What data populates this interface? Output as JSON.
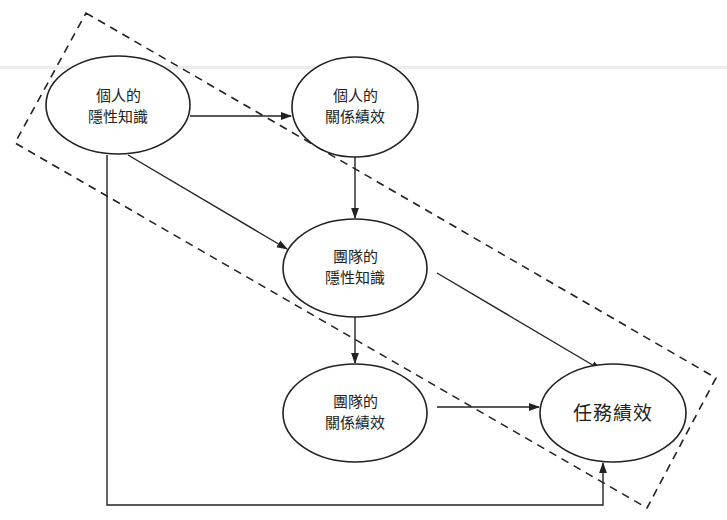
{
  "diagram": {
    "style": {
      "stroke": "#222222",
      "background": "#ffffff"
    },
    "group_boundary": {
      "label": "",
      "style": "dashed",
      "corners": [
        [
          86,
          13
        ],
        [
          716,
          378
        ],
        [
          647,
          508
        ],
        [
          15,
          143
        ]
      ]
    },
    "nodes": [
      {
        "id": "individual-tacit-knowledge",
        "line1": "個人的",
        "line2": "隱性知識",
        "cx": 118,
        "cy": 105,
        "rx": 72,
        "ry": 49
      },
      {
        "id": "individual-relational-performance",
        "line1": "個人的",
        "line2": "關係績效",
        "cx": 355,
        "cy": 107,
        "rx": 63,
        "ry": 50
      },
      {
        "id": "team-tacit-knowledge",
        "line1": "團隊的",
        "line2": "隱性知識",
        "cx": 355,
        "cy": 268,
        "rx": 72,
        "ry": 49
      },
      {
        "id": "team-relational-performance",
        "line1": "團隊的",
        "line2": "關係績效",
        "cx": 355,
        "cy": 413,
        "rx": 72,
        "ry": 49
      },
      {
        "id": "task-performance",
        "line1": "任務績效",
        "line2": "",
        "cx": 613,
        "cy": 413,
        "rx": 73,
        "ry": 49
      }
    ],
    "edges": [
      {
        "from": "個人的隱性知識",
        "to": "個人的關係績效"
      },
      {
        "from": "個人的隱性知識",
        "to": "團隊的隱性知識"
      },
      {
        "from": "個人的隱性知識",
        "to": "任務績效"
      },
      {
        "from": "個人的關係績效",
        "to": "團隊的隱性知識"
      },
      {
        "from": "團隊的隱性知識",
        "to": "團隊的關係績效"
      },
      {
        "from": "團隊的隱性知識",
        "to": "任務績效"
      },
      {
        "from": "團隊的關係績效",
        "to": "任務績效"
      }
    ]
  }
}
